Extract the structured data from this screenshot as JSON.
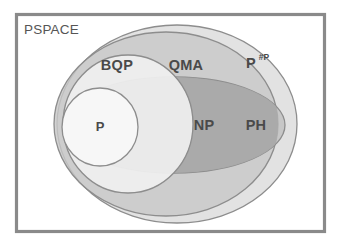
{
  "diagram": {
    "frame": {
      "label": "PSPACE",
      "border_color": "#8a8a8a",
      "background_color": "#ffffff"
    },
    "regions": [
      {
        "id": "ppsharp",
        "label": "P",
        "superscript": "#P",
        "shape": "ellipse",
        "fill": "#e2e2e2",
        "stroke": "#8d8d8d"
      },
      {
        "id": "qma",
        "label": "QMA",
        "superscript": "",
        "shape": "ellipse",
        "fill": "#c8c8c8",
        "stroke": "#8d8d8d"
      },
      {
        "id": "ph",
        "label": "PH",
        "superscript": "",
        "shape": "ellipse",
        "fill": "#bdbdbd",
        "stroke": "#8d8d8d"
      },
      {
        "id": "np",
        "label": "NP",
        "superscript": "",
        "shape": "overlap",
        "fill": "#a9a9a9",
        "stroke": "#8d8d8d"
      },
      {
        "id": "bqp",
        "label": "BQP",
        "superscript": "",
        "shape": "circle",
        "fill": "#efefef",
        "stroke": "#8d8d8d"
      },
      {
        "id": "p",
        "label": "P",
        "superscript": "",
        "shape": "circle",
        "fill": "#f7f7f7",
        "stroke": "#7d7d7d"
      }
    ],
    "label_color": "#4a4a4a"
  }
}
